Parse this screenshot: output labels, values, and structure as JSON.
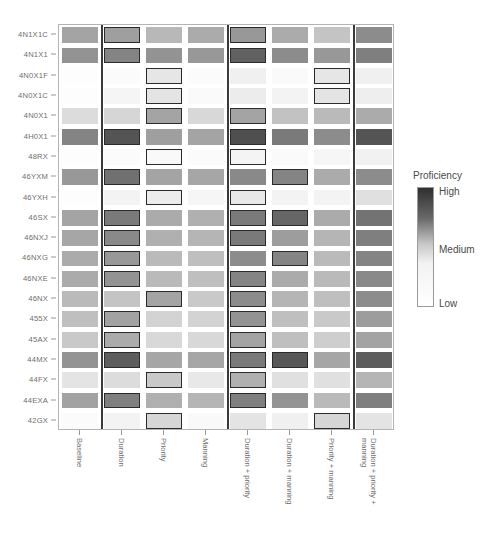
{
  "chart_data": {
    "type": "heatmap",
    "title": "",
    "xlabel": "",
    "ylabel": "",
    "grid": false,
    "legend_position": "right",
    "columns": [
      "Baseline",
      "Duration",
      "Priority",
      "Manning",
      "Duration + priority",
      "Duration + manning",
      "Priority + manning",
      "Duration + priority + manning"
    ],
    "rows": [
      "4N1X1C",
      "4N1X1",
      "4N0X1F",
      "4N0X1C",
      "4N0X1",
      "4H0X1",
      "48RX",
      "46YXM",
      "46YXH",
      "46SX",
      "46NXJ",
      "46NXG",
      "46NXE",
      "46NX",
      "455X",
      "45AX",
      "44MX",
      "44FX",
      "44EXA",
      "42GX"
    ],
    "group_separators_after_columns": [
      1,
      4,
      7
    ],
    "colorscale": {
      "name": "Proficiency",
      "high_label": "High",
      "medium_label": "Medium",
      "low_label": "Low",
      "high_color": "#2f2f2f",
      "medium_color": "#c9c9c9",
      "low_color": "#ffffff"
    },
    "value_range": [
      0,
      1
    ],
    "note": "values are normalized proficiency 0 (Low, white) .. 1 (High, dark); highlighted cells carry a black outline",
    "values": [
      [
        0.45,
        0.47,
        0.37,
        0.42,
        0.5,
        0.42,
        0.32,
        0.55
      ],
      [
        0.52,
        0.58,
        0.52,
        0.5,
        0.72,
        0.55,
        0.5,
        0.6
      ],
      [
        0.02,
        0.03,
        0.17,
        0.03,
        0.12,
        0.04,
        0.17,
        0.12
      ],
      [
        0.02,
        0.08,
        0.18,
        0.04,
        0.14,
        0.1,
        0.18,
        0.13
      ],
      [
        0.22,
        0.25,
        0.45,
        0.24,
        0.45,
        0.33,
        0.36,
        0.42
      ],
      [
        0.58,
        0.78,
        0.47,
        0.45,
        0.8,
        0.62,
        0.55,
        0.78
      ],
      [
        0.02,
        0.03,
        0.05,
        0.03,
        0.09,
        0.04,
        0.07,
        0.11
      ],
      [
        0.5,
        0.66,
        0.45,
        0.44,
        0.56,
        0.58,
        0.42,
        0.55
      ],
      [
        0.02,
        0.1,
        0.14,
        0.07,
        0.16,
        0.1,
        0.1,
        0.2
      ],
      [
        0.45,
        0.62,
        0.42,
        0.4,
        0.62,
        0.7,
        0.42,
        0.65
      ],
      [
        0.44,
        0.56,
        0.4,
        0.38,
        0.62,
        0.48,
        0.38,
        0.6
      ],
      [
        0.42,
        0.5,
        0.36,
        0.34,
        0.55,
        0.58,
        0.36,
        0.58
      ],
      [
        0.42,
        0.52,
        0.36,
        0.34,
        0.58,
        0.42,
        0.36,
        0.56
      ],
      [
        0.36,
        0.32,
        0.45,
        0.3,
        0.55,
        0.38,
        0.34,
        0.55
      ],
      [
        0.34,
        0.46,
        0.26,
        0.26,
        0.52,
        0.34,
        0.3,
        0.48
      ],
      [
        0.3,
        0.42,
        0.24,
        0.24,
        0.45,
        0.34,
        0.28,
        0.45
      ],
      [
        0.52,
        0.74,
        0.44,
        0.44,
        0.62,
        0.76,
        0.44,
        0.74
      ],
      [
        0.18,
        0.22,
        0.3,
        0.16,
        0.4,
        0.2,
        0.2,
        0.38
      ],
      [
        0.46,
        0.6,
        0.4,
        0.38,
        0.6,
        0.52,
        0.36,
        0.6
      ],
      [
        0.03,
        0.1,
        0.25,
        0.05,
        0.18,
        0.12,
        0.25,
        0.18
      ]
    ],
    "highlighted": [
      [
        0,
        1
      ],
      [
        0,
        4
      ],
      [
        1,
        1
      ],
      [
        1,
        4
      ],
      [
        2,
        2
      ],
      [
        2,
        6
      ],
      [
        3,
        2
      ],
      [
        3,
        6
      ],
      [
        4,
        2
      ],
      [
        4,
        4
      ],
      [
        5,
        1
      ],
      [
        5,
        4
      ],
      [
        6,
        2
      ],
      [
        6,
        4
      ],
      [
        7,
        1
      ],
      [
        7,
        5
      ],
      [
        8,
        2
      ],
      [
        8,
        4
      ],
      [
        9,
        1
      ],
      [
        9,
        4
      ],
      [
        9,
        5
      ],
      [
        10,
        1
      ],
      [
        10,
        4
      ],
      [
        11,
        1
      ],
      [
        11,
        5
      ],
      [
        12,
        1
      ],
      [
        12,
        4
      ],
      [
        13,
        2
      ],
      [
        13,
        4
      ],
      [
        14,
        1
      ],
      [
        14,
        4
      ],
      [
        15,
        1
      ],
      [
        15,
        4
      ],
      [
        16,
        1
      ],
      [
        16,
        4
      ],
      [
        16,
        5
      ],
      [
        17,
        2
      ],
      [
        17,
        4
      ],
      [
        18,
        1
      ],
      [
        18,
        4
      ],
      [
        19,
        2
      ],
      [
        19,
        6
      ]
    ]
  }
}
